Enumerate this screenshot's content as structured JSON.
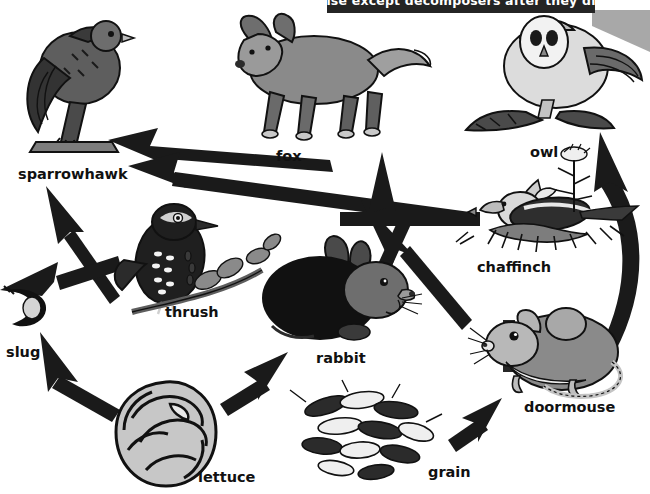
{
  "banner": {
    "text": "else except decomposers after they die",
    "bg_color": "#242424",
    "text_color": "#ffffff",
    "shadow_color": "#a8a8a8"
  },
  "diagram": {
    "arrow_color": "#1a1a1a",
    "background_color": "#ffffff",
    "organisms": [
      {
        "id": "sparrowhawk",
        "label": "sparrowhawk",
        "role": "predator",
        "label_x": 18,
        "label_y": 166,
        "font_size": 14.5
      },
      {
        "id": "fox",
        "label": "fox",
        "role": "predator",
        "label_x": 276,
        "label_y": 148,
        "font_size": 14.5
      },
      {
        "id": "owl",
        "label": "owl",
        "role": "predator",
        "label_x": 530,
        "label_y": 144,
        "font_size": 14.5
      },
      {
        "id": "chaffinch",
        "label": "chaffinch",
        "role": "consumer",
        "label_x": 477,
        "label_y": 259,
        "font_size": 14.5
      },
      {
        "id": "thrush",
        "label": "thrush",
        "role": "consumer",
        "label_x": 165,
        "label_y": 304,
        "font_size": 14.5
      },
      {
        "id": "slug",
        "label": "slug",
        "role": "consumer",
        "label_x": 6,
        "label_y": 344,
        "font_size": 14.5
      },
      {
        "id": "rabbit",
        "label": "rabbit",
        "role": "consumer",
        "label_x": 316,
        "label_y": 350,
        "font_size": 14.5
      },
      {
        "id": "doormouse",
        "label": "doormouse",
        "role": "consumer",
        "label_x": 524,
        "label_y": 399,
        "font_size": 14.5
      },
      {
        "id": "lettuce",
        "label": "lettuce",
        "role": "producer",
        "label_x": 198,
        "label_y": 469,
        "font_size": 14.5
      },
      {
        "id": "grain",
        "label": "grain",
        "role": "producer",
        "label_x": 428,
        "label_y": 464,
        "font_size": 14.5
      }
    ],
    "links": [
      {
        "from": "thrush",
        "to": "sparrowhawk"
      },
      {
        "from": "rabbit",
        "to": "sparrowhawk"
      },
      {
        "from": "chaffinch",
        "to": "sparrowhawk"
      },
      {
        "from": "slug",
        "to": "thrush"
      },
      {
        "from": "lettuce",
        "to": "slug"
      },
      {
        "from": "lettuce",
        "to": "rabbit"
      },
      {
        "from": "rabbit",
        "to": "fox"
      },
      {
        "from": "grain",
        "to": "doormouse"
      },
      {
        "from": "doormouse",
        "to": "owl"
      },
      {
        "from": "doormouse",
        "to": "fox"
      },
      {
        "from": "grain",
        "to": "chaffinch"
      }
    ]
  }
}
